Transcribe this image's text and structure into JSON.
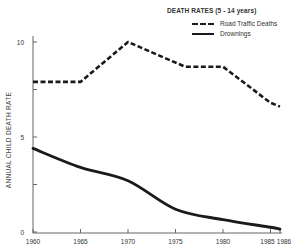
{
  "chart_data": {
    "type": "line",
    "title": "DEATH RATES (5 - 14 years)",
    "xlabel": "",
    "ylabel": "ANNUAL CHILD DEATH RATE",
    "xlim": [
      1960,
      1986
    ],
    "ylim": [
      0,
      10
    ],
    "x_ticks": [
      1960,
      1965,
      1970,
      1975,
      1980,
      1985,
      1986
    ],
    "y_ticks": [
      0,
      5,
      10
    ],
    "y_minor_ticks": [
      2.5,
      7.5
    ],
    "grid": false,
    "legend_position": "top-right",
    "series": [
      {
        "name": "Road Traffic Deaths",
        "style": "dashed",
        "x": [
          1960,
          1965,
          1970,
          1976,
          1980,
          1985,
          1986
        ],
        "values": [
          7.9,
          7.9,
          10.0,
          8.7,
          8.7,
          6.8,
          6.6
        ]
      },
      {
        "name": "Drownings",
        "style": "solid",
        "x": [
          1960,
          1965,
          1970,
          1975,
          1980,
          1985,
          1986
        ],
        "values": [
          4.4,
          3.4,
          2.7,
          1.2,
          0.65,
          0.25,
          0.15
        ]
      }
    ]
  },
  "legend": {
    "title": "DEATH RATES (5 - 14 years)",
    "items": [
      {
        "label": "Road Traffic Deaths",
        "style": "dashed"
      },
      {
        "label": "Drownings",
        "style": "solid"
      }
    ]
  },
  "axes": {
    "y_label": "ANNUAL CHILD DEATH RATE",
    "y_tick_labels": [
      "0",
      "5",
      "10"
    ],
    "x_tick_labels": [
      "1960",
      "1965",
      "1970",
      "1975",
      "1980",
      "1985",
      "1986"
    ]
  },
  "colors": {
    "line": "#1a1a1a",
    "axis": "#666666",
    "text": "#333333"
  }
}
